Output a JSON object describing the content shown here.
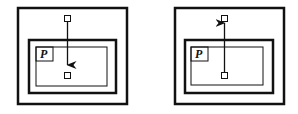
{
  "diagrams": [
    {
      "id": "left",
      "region_label": "P",
      "arrow_direction": "down",
      "description": "Arrow from node outside region P to node inside region P"
    },
    {
      "id": "right",
      "region_label": "P",
      "arrow_direction": "up",
      "description": "Arrow from node inside region P to node outside region P"
    }
  ],
  "colors": {
    "stroke": "#111111",
    "background": "#ffffff"
  }
}
